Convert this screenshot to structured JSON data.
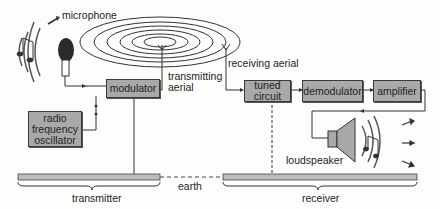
{
  "diagram": {
    "colors": {
      "box_fill": "#a9a9a9",
      "line": "#333333",
      "ground": "#bdbdbd"
    },
    "labels": {
      "microphone": "microphone",
      "transmitting_aerial_1": "transmitting",
      "transmitting_aerial_2": "aerial",
      "receiving_aerial": "receiving aerial",
      "loudspeaker": "loudspeaker",
      "earth": "earth",
      "transmitter": "transmitter",
      "receiver": "receiver"
    },
    "blocks": {
      "modulator": "modulator",
      "rf_osc_1": "radio",
      "rf_osc_2": "frequency",
      "rf_osc_3": "oscillator",
      "tuned_1": "tuned",
      "tuned_2": "circuit",
      "demodulator": "demodulator",
      "amplifier": "amplifier"
    }
  }
}
